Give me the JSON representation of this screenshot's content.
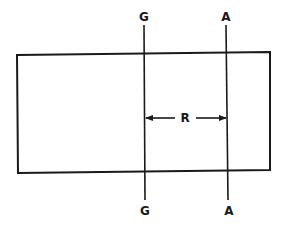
{
  "diagram": {
    "colors": {
      "stroke": "#1a1a1a",
      "background": "#ffffff"
    },
    "rectangle": {
      "x": 17,
      "y": 53,
      "width": 253,
      "height": 119
    },
    "lines": [
      {
        "id": "G",
        "top_label": "G",
        "bottom_label": "G",
        "x_top": 144,
        "x_bottom": 145,
        "y_top": 25,
        "y_bottom": 200
      },
      {
        "id": "A",
        "top_label": "A",
        "bottom_label": "A",
        "x_top": 226,
        "x_bottom": 228,
        "y_top": 25,
        "y_bottom": 200
      }
    ],
    "dimension": {
      "label": "R",
      "from": "G",
      "to": "A",
      "y": 118
    }
  }
}
